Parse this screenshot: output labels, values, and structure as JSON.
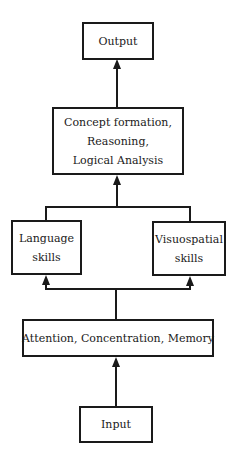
{
  "diagram": {
    "type": "flowchart",
    "direction": "bottom-to-top",
    "nodes": {
      "output": {
        "lines": [
          "Output"
        ]
      },
      "concept": {
        "lines": [
          "Concept formation,",
          "Reasoning,",
          "Logical Analysis"
        ]
      },
      "language": {
        "lines": [
          "Language",
          "skills"
        ]
      },
      "visuospatial": {
        "lines": [
          "Visuospatial",
          "skills"
        ]
      },
      "attention": {
        "lines": [
          "Attention, Concentration, Memory"
        ]
      },
      "input": {
        "lines": [
          "Input"
        ]
      }
    },
    "edges": [
      {
        "from": "input",
        "to": "attention"
      },
      {
        "from": "attention",
        "to": "language"
      },
      {
        "from": "attention",
        "to": "visuospatial"
      },
      {
        "from": "language",
        "to": "concept"
      },
      {
        "from": "visuospatial",
        "to": "concept"
      },
      {
        "from": "concept",
        "to": "output"
      }
    ],
    "colors": {
      "stroke": "#1a1a1a",
      "background": "#ffffff"
    }
  }
}
